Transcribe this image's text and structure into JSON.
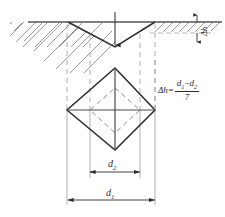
{
  "figure": {
    "colors": {
      "outline": "#2b2b2b",
      "surface_line": "#555555",
      "hatch": "#6e6e6e",
      "dashed_guide": "#9a9a9a",
      "inner_diamond": "#8d8d8d",
      "background": "#ffffff"
    }
  },
  "labels": {
    "delta_h_top": "Δh",
    "formula": {
      "lhs": "Δh=",
      "numerator_first": "d",
      "numerator_first_sub": "1",
      "numerator_minus": "−",
      "numerator_second": "d",
      "numerator_second_sub": "2",
      "denominator": "7"
    },
    "d2": {
      "symbol": "d",
      "subscript": "2"
    },
    "d1": {
      "symbol": "d",
      "subscript": "1"
    }
  },
  "geometry": {
    "surface_line_y": 22,
    "groove_apex": {
      "x": 115,
      "y": 47
    },
    "groove_left_x": 68,
    "groove_right_x": 155,
    "delta_h_value_y_top": 22,
    "delta_h_value_y_bottom": 33,
    "outer_diamond": {
      "left_x": 67,
      "right_x": 155,
      "top_y": 68,
      "bottom_y": 150,
      "center_x": 115,
      "center_y": 110
    },
    "inner_diamond": {
      "left_x": 90,
      "right_x": 140,
      "top_y": 88,
      "bottom_y": 133
    },
    "d2_dimension": {
      "x1": 90,
      "x2": 140,
      "y": 172
    },
    "d1_dimension": {
      "x1": 68,
      "x2": 155,
      "y": 200
    },
    "load_arrow": {
      "x": 115,
      "y_start": 12,
      "y_end": 47
    }
  }
}
